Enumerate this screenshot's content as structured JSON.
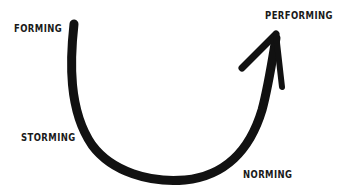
{
  "diagram": {
    "type": "tuckman-stages-of-group-development",
    "colors": {
      "background": "#ffffff",
      "stroke": "#111111",
      "text": "#1a1a1a"
    },
    "stages": [
      {
        "id": "forming",
        "label": "FORMING",
        "order": 1
      },
      {
        "id": "storming",
        "label": "STORMING",
        "order": 2
      },
      {
        "id": "norming",
        "label": "NORMING",
        "order": 3
      },
      {
        "id": "performing",
        "label": "PERFORMING",
        "order": 4
      }
    ],
    "arrow": {
      "icon": "curved-arrow-icon",
      "direction": "forming-to-performing"
    }
  }
}
